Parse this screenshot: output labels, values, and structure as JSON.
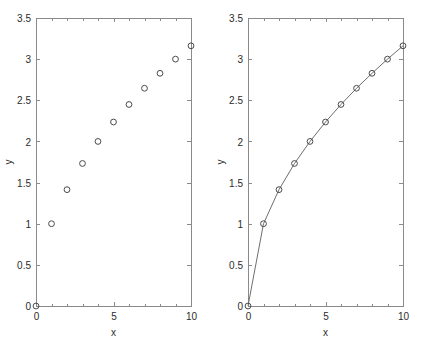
{
  "figure": {
    "background_color": "#ffffff",
    "axis_color": "#8a8a8a",
    "marker_color": "#4a4a4a",
    "line_color": "#6e6e6e",
    "text_color": "#2b2b2b"
  },
  "chart_data": [
    {
      "type": "scatter",
      "panel": "left",
      "title": "",
      "xlabel": "x",
      "ylabel": "y",
      "xlim": [
        0,
        10
      ],
      "ylim": [
        0,
        3.5
      ],
      "xticks": [
        0,
        5,
        10
      ],
      "xticklabels": [
        "0",
        "5",
        "10"
      ],
      "xminorticks": [
        1,
        2,
        3,
        4,
        6,
        7,
        8,
        9
      ],
      "yticks": [
        0,
        0.5,
        1,
        1.5,
        2,
        2.5,
        3,
        3.5
      ],
      "yticklabels": [
        "0",
        "0.5",
        "1",
        "1.5",
        "2",
        "2.5",
        "3",
        "3.5"
      ],
      "grid": false,
      "legend": null,
      "marker": "open-circle",
      "line_style": "none",
      "series": [
        {
          "name": "sqrt(x)",
          "x": [
            0,
            1,
            2,
            3,
            4,
            5,
            6,
            7,
            8,
            9,
            10
          ],
          "y": [
            0,
            1,
            1.414,
            1.732,
            2,
            2.236,
            2.449,
            2.646,
            2.828,
            3,
            3.162
          ]
        }
      ]
    },
    {
      "type": "line",
      "panel": "right",
      "title": "",
      "xlabel": "x",
      "ylabel": "y",
      "xlim": [
        0,
        10
      ],
      "ylim": [
        0,
        3.5
      ],
      "xticks": [
        0,
        5,
        10
      ],
      "xticklabels": [
        "0",
        "5",
        "10"
      ],
      "xminorticks": [
        1,
        2,
        3,
        4,
        6,
        7,
        8,
        9
      ],
      "yticks": [
        0,
        0.5,
        1,
        1.5,
        2,
        2.5,
        3,
        3.5
      ],
      "yticklabels": [
        "0",
        "0.5",
        "1",
        "1.5",
        "2",
        "2.5",
        "3",
        "3.5"
      ],
      "grid": false,
      "legend": null,
      "marker": "open-circle",
      "line_style": "solid",
      "series": [
        {
          "name": "sqrt(x)",
          "x": [
            0,
            1,
            2,
            3,
            4,
            5,
            6,
            7,
            8,
            9,
            10
          ],
          "y": [
            0,
            1,
            1.414,
            1.732,
            2,
            2.236,
            2.449,
            2.646,
            2.828,
            3,
            3.162
          ]
        }
      ]
    }
  ]
}
